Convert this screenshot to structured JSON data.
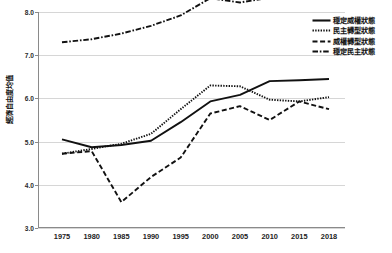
{
  "chart_data": {
    "type": "line",
    "title": "",
    "subtitle": "",
    "xlabel": "",
    "ylabel": "經濟自由度均值",
    "x": [
      "1975",
      "1980",
      "1985",
      "1990",
      "1995",
      "2000",
      "2005",
      "2010",
      "2015",
      "2018"
    ],
    "categories": [
      "1975",
      "1980",
      "1985",
      "1990",
      "1995",
      "2000",
      "2005",
      "2010",
      "2015",
      "2018"
    ],
    "ylim": [
      3.0,
      8.0
    ],
    "yticks": [
      "8.0",
      "7.0",
      "6.0",
      "5.0",
      "4.0",
      "3.0"
    ],
    "ytick_values": [
      8.0,
      7.0,
      6.0,
      5.0,
      4.0,
      3.0
    ],
    "grid": true,
    "legend_position": "top-right",
    "series": [
      {
        "name": "穩定威權狀態",
        "style": "solid",
        "color": "#111111",
        "values": [
          5.05,
          4.87,
          4.92,
          5.02,
          5.45,
          5.93,
          6.08,
          6.4,
          6.42,
          6.45
        ]
      },
      {
        "name": "民主轉型狀態",
        "style": "dotted",
        "color": "#111111",
        "values": [
          4.72,
          4.83,
          4.95,
          5.18,
          5.75,
          6.3,
          6.28,
          5.97,
          5.93,
          6.03
        ]
      },
      {
        "name": "威權轉型狀態",
        "style": "dashed",
        "color": "#111111",
        "values": [
          4.72,
          4.78,
          3.6,
          4.18,
          4.63,
          5.65,
          5.82,
          5.5,
          5.93,
          5.75
        ]
      },
      {
        "name": "穩定民主狀態",
        "style": "dash-dot",
        "color": "#111111",
        "values": [
          7.3,
          7.37,
          7.5,
          7.68,
          7.92,
          8.32,
          8.22,
          8.33,
          8.37,
          8.37
        ]
      }
    ]
  },
  "legend": {
    "items": [
      {
        "label": "穩定威權狀態",
        "style": "solid"
      },
      {
        "label": "民主轉型狀態",
        "style": "dotted"
      },
      {
        "label": "威權轉型狀態",
        "style": "dashed"
      },
      {
        "label": "穩定民主狀態",
        "style": "dash-dot"
      }
    ]
  }
}
